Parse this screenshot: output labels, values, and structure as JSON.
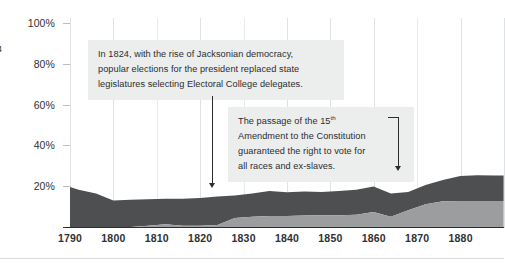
{
  "chart_data": {
    "type": "area",
    "title": "",
    "subtitle": "",
    "xlabel": "",
    "ylabel": "",
    "stacked": true,
    "grid": true,
    "legend_position": "none",
    "xlim": [
      1790,
      1890
    ],
    "ylim": [
      0,
      100
    ],
    "y_ticks": [
      "20%",
      "40%",
      "60%",
      "80%",
      "100%"
    ],
    "y_tick_values": [
      20,
      40,
      60,
      80,
      100
    ],
    "x_ticks": [
      "1790",
      "1800",
      "1810",
      "1820",
      "1830",
      "1840",
      "1850",
      "1860",
      "1870",
      "1880"
    ],
    "x_tick_values": [
      1790,
      1800,
      1810,
      1820,
      1830,
      1840,
      1850,
      1860,
      1870,
      1880
    ],
    "x": [
      1790,
      1792,
      1796,
      1800,
      1804,
      1808,
      1812,
      1816,
      1820,
      1824,
      1828,
      1832,
      1836,
      1840,
      1844,
      1848,
      1852,
      1856,
      1860,
      1864,
      1868,
      1872,
      1876,
      1880,
      1884,
      1888,
      1890
    ],
    "series": [
      {
        "name": "lower-band",
        "color": "#9b9d9f",
        "values": [
          0,
          0,
          0,
          0,
          0,
          0.6,
          1.4,
          0.6,
          0.6,
          1.0,
          4.4,
          5.0,
          5.4,
          5.4,
          5.6,
          5.8,
          5.8,
          6.0,
          7.4,
          5.0,
          8.2,
          11.2,
          12.6,
          12.8,
          12.8,
          12.8,
          12.8
        ]
      },
      {
        "name": "upper-band",
        "color": "#4d4f51",
        "values": [
          19.6,
          18.2,
          16.4,
          13.0,
          13.4,
          13.0,
          12.4,
          13.2,
          13.6,
          14.0,
          11.0,
          11.4,
          12.2,
          11.6,
          11.8,
          11.4,
          11.8,
          12.2,
          12.4,
          11.4,
          9.0,
          9.4,
          10.4,
          12.2,
          12.6,
          12.4,
          12.4
        ]
      }
    ],
    "total_top_values": [
      19.6,
      18.2,
      16.4,
      13.0,
      13.4,
      13.6,
      13.8,
      13.8,
      14.2,
      15.0,
      15.4,
      16.4,
      17.6,
      17.0,
      17.4,
      17.2,
      17.6,
      18.2,
      19.8,
      16.4,
      17.2,
      20.6,
      23.0,
      25.0,
      25.4,
      25.2,
      25.2
    ]
  },
  "annotations": [
    {
      "id": "note-1824",
      "target_year": 1824,
      "lines": [
        "In 1824, with the rise of Jacksonian democracy,",
        "popular elections for the president replaced state",
        "legislatures selecting Electoral College delegates."
      ]
    },
    {
      "id": "note-15th",
      "target_year": 1870,
      "lines_pre_sup": "The passage of the 15",
      "sup": "th",
      "lines": [
        "Amendment to the Constitution",
        "guaranteed the right to vote for",
        "all races and ex-slaves."
      ]
    }
  ],
  "edge_fragment": "4",
  "colors": {
    "upper_band": "#4d4f51",
    "lower_band": "#9b9d9f",
    "note_background": "#eceded",
    "text": "#2b2d2f",
    "gridline": "#dfe1e2",
    "axis": "#2b2d2f",
    "page_background": "#ffffff"
  }
}
